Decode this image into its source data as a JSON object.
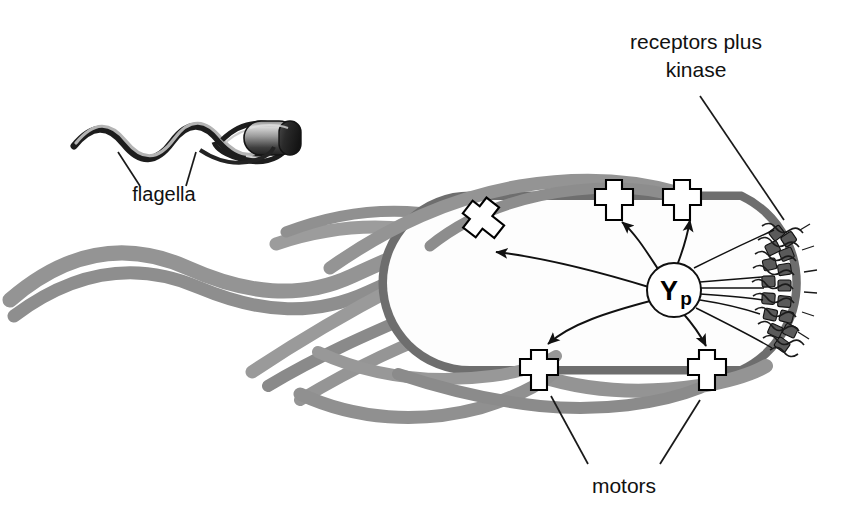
{
  "figure": {
    "background_color": "#ffffff"
  },
  "labels": {
    "receptors": {
      "line1": "receptors plus",
      "line2": "kinase"
    },
    "flagella": "flagella",
    "motors": "motors",
    "signal_molecule": {
      "main": "Y",
      "subscript": "p"
    }
  },
  "colors": {
    "membrane": "#6e6e6e",
    "flagella": "#949494",
    "flagella_dark": "#7c7c7c",
    "receptor_block": "#5d5d5d",
    "ink": "#111111",
    "motor_fill": "#ffffff",
    "inset_body_dark": "#2b2b2b",
    "inset_body_light": "#c9c9c9"
  },
  "counts": {
    "motors": 5,
    "signal_arrows": 5,
    "receptor_lines": 4,
    "flagella_strands": 5
  },
  "structure": {
    "cell_orientation": "horizontal capsule, receptor pole at right",
    "receptor_cluster_position": "right pole",
    "flagella_bundle_direction": "trailing to the left"
  }
}
